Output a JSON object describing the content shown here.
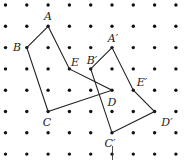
{
  "grid": {
    "cols": 9,
    "rows": 8,
    "origin_x": 5.5,
    "origin_y": 5,
    "spacing": 21.3,
    "dot_color": "#111111"
  },
  "shapes": [
    {
      "name": "original-pentagon",
      "vertices": [
        {
          "label": "A",
          "col": 2,
          "row": 1,
          "lx": 48,
          "ly": 16
        },
        {
          "label": "B",
          "col": 1,
          "row": 2,
          "lx": 17,
          "ly": 47
        },
        {
          "label": "C",
          "col": 2,
          "row": 5,
          "lx": 47,
          "ly": 122
        },
        {
          "label": "D",
          "col": 5,
          "row": 4,
          "lx": 112,
          "ly": 102
        },
        {
          "label": "E",
          "col": 3,
          "row": 3,
          "lx": 75,
          "ly": 62
        }
      ]
    },
    {
      "name": "translated-pentagon",
      "vertices": [
        {
          "label": "A′",
          "col": 5,
          "row": 2,
          "lx": 113,
          "ly": 38
        },
        {
          "label": "B′",
          "col": 4,
          "row": 3,
          "lx": 92,
          "ly": 60
        },
        {
          "label": "C′",
          "col": 5,
          "row": 6,
          "lx": 110,
          "ly": 143
        },
        {
          "label": "D′",
          "col": 7,
          "row": 5,
          "lx": 167,
          "ly": 122
        },
        {
          "label": "E′",
          "col": 6,
          "row": 4,
          "lx": 142,
          "ly": 82
        }
      ]
    }
  ],
  "line_color": "#222222"
}
